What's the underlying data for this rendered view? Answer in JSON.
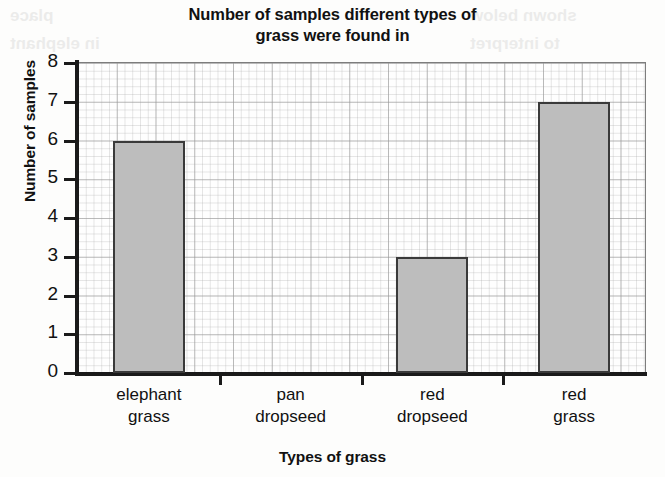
{
  "chart_data": {
    "type": "bar",
    "title": "Number of samples different types of grass were found in",
    "title_line1": "Number of samples different types of",
    "title_line2": "grass were found in",
    "xlabel": "Types of grass",
    "ylabel": "Number of samples",
    "categories": [
      "elephant grass",
      "pan dropseed",
      "red dropseed",
      "red grass"
    ],
    "category_lines": [
      [
        "elephant",
        "grass"
      ],
      [
        "pan",
        "dropseed"
      ],
      [
        "red",
        "dropseed"
      ],
      [
        "red",
        "grass"
      ]
    ],
    "values": [
      6,
      0,
      3,
      7
    ],
    "ylim": [
      0,
      8
    ],
    "ytick_labels": [
      "0",
      "1",
      "2",
      "3",
      "4",
      "5",
      "6",
      "7",
      "8"
    ],
    "ytick_values": [
      0,
      1,
      2,
      3,
      4,
      5,
      6,
      7,
      8
    ],
    "grid": true,
    "legend": false,
    "bar_color": "#bdbdbd",
    "bar_border_color": "#3a3a3a",
    "axis_color": "#1a1a1a",
    "background_color": "#fdfdfc"
  },
  "bleed_through": {
    "line1": "shown below",
    "line2": "to interpret",
    "line3": "place",
    "line4": "in elephant"
  }
}
